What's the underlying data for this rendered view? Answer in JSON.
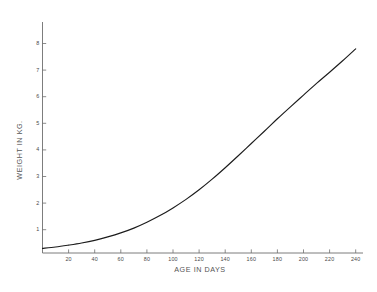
{
  "chart_data": {
    "type": "line",
    "title": "",
    "subtitle": "",
    "xlabel": "AGE IN DAYS",
    "ylabel": "WEIGHT IN KG.",
    "xlim": [
      0,
      248
    ],
    "ylim": [
      0,
      8.6
    ],
    "xticks": [
      20,
      40,
      60,
      80,
      100,
      120,
      140,
      160,
      180,
      200,
      220,
      240
    ],
    "xticklabels": [
      "20",
      "40",
      "60",
      "80",
      "100",
      "120",
      "140",
      "160",
      "180",
      "200",
      "220",
      "240"
    ],
    "yticks": [
      1,
      2,
      3,
      4,
      5,
      6,
      7,
      8
    ],
    "yticklabels": [
      "1",
      "2",
      "3",
      "4",
      "5",
      "6",
      "7",
      "8"
    ],
    "grid": false,
    "legend": false,
    "legend_position": "none",
    "series": [
      {
        "name": "weight",
        "color": "#1c1c1c",
        "x": [
          0,
          10,
          20,
          30,
          40,
          50,
          60,
          70,
          80,
          90,
          100,
          110,
          120,
          130,
          140,
          150,
          160,
          170,
          180,
          190,
          200,
          210,
          220,
          230,
          240
        ],
        "y": [
          0.3,
          0.35,
          0.42,
          0.5,
          0.6,
          0.73,
          0.88,
          1.06,
          1.28,
          1.53,
          1.82,
          2.14,
          2.5,
          2.9,
          3.33,
          3.78,
          4.24,
          4.7,
          5.17,
          5.62,
          6.06,
          6.5,
          6.92,
          7.35,
          7.8
        ]
      }
    ],
    "annotations": []
  },
  "axes": {
    "x_axis_title": "AGE IN DAYS",
    "y_axis_title": "WEIGHT IN KG."
  },
  "colors": {
    "background": "#ffffff",
    "axis": "#6e6e6e",
    "curve": "#1c1c1c",
    "text": "#4a4a4a"
  }
}
